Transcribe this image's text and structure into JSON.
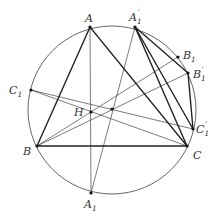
{
  "figure": {
    "circle": {
      "cx": 112,
      "cy": 110,
      "r": 84,
      "stroke": "#555555"
    },
    "points": {
      "A": {
        "label": "A",
        "sub": "",
        "prime": "",
        "x": 90,
        "y": 27,
        "lx": 86,
        "ly": 22
      },
      "B": {
        "label": "B",
        "sub": "",
        "prime": "",
        "x": 37,
        "y": 146,
        "lx": 23,
        "ly": 154
      },
      "C": {
        "label": "C",
        "sub": "",
        "prime": "",
        "x": 187,
        "y": 146,
        "lx": 193,
        "ly": 158
      },
      "H": {
        "label": "H",
        "sub": "",
        "prime": "",
        "x": 91,
        "y": 112,
        "lx": 74,
        "ly": 116
      },
      "P": {
        "label": "",
        "sub": "",
        "prime": "",
        "x": 112,
        "y": 109
      },
      "A1": {
        "label": "A",
        "sub": "1",
        "prime": "",
        "x": 91,
        "y": 193,
        "lx": 84,
        "ly": 209
      },
      "A1p": {
        "label": "A",
        "sub": "1",
        "prime": "′",
        "x": 135,
        "y": 27,
        "lx": 130,
        "ly": 22
      },
      "B1": {
        "label": "B",
        "sub": "1",
        "prime": "",
        "x": 178,
        "y": 57,
        "lx": 183,
        "ly": 56
      },
      "B1p": {
        "label": "B",
        "sub": "1",
        "prime": "′",
        "x": 188,
        "y": 73,
        "lx": 194,
        "ly": 77
      },
      "C1": {
        "label": "C",
        "sub": "1",
        "prime": "",
        "x": 31,
        "y": 90,
        "lx": 10,
        "ly": 95
      },
      "C1p": {
        "label": "C",
        "sub": "1",
        "prime": "′",
        "x": 193,
        "y": 129,
        "lx": 196,
        "ly": 132
      }
    },
    "thick_segments": [
      [
        "A",
        "B"
      ],
      [
        "B",
        "C"
      ],
      [
        "C",
        "A"
      ],
      [
        "A1p",
        "B1p"
      ],
      [
        "B1p",
        "C1p"
      ],
      [
        "C1p",
        "A1p"
      ],
      [
        "A1p",
        "C"
      ]
    ],
    "thin_segments": [
      [
        "A",
        "A1"
      ],
      [
        "A1",
        "A1p"
      ],
      [
        "B",
        "B1"
      ],
      [
        "B",
        "B1p"
      ],
      [
        "C1",
        "C"
      ],
      [
        "C1",
        "C1p"
      ]
    ],
    "labels": {
      "A": "A",
      "B": "B",
      "C": "C",
      "H": "H",
      "A1": "A",
      "A1_sub": "1",
      "A1p": "A",
      "A1p_sub": "1",
      "A1p_prime": "′",
      "B1": "B",
      "B1_sub": "1",
      "B1p": "B",
      "B1p_sub": "1",
      "B1p_prime": "′",
      "C1": "C",
      "C1_sub": "1",
      "C1p": "C",
      "C1p_sub": "1",
      "C1p_prime": "′"
    }
  }
}
